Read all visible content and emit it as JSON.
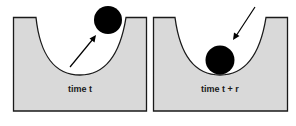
{
  "panels": [
    {
      "label": "time t",
      "ball_position": "upper-right rim, leaving the well",
      "arrow_direction": "up-right"
    },
    {
      "label": "time t + r",
      "ball_position": "bottom of the well",
      "arrow_direction": "down-left"
    }
  ],
  "colors": {
    "well_fill": "#d9d9d9",
    "outline": "#1a1a1a",
    "ball": "#000000",
    "background": "#ffffff"
  }
}
